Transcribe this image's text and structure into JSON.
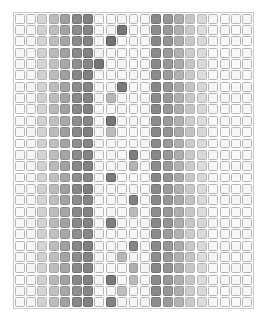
{
  "figure": {
    "title": "",
    "background_color": "#ffffff",
    "frame_color": "#c9c9c9",
    "cell_border_color": "#b5b5b5"
  },
  "chart_data": {
    "type": "heatmap",
    "title": "",
    "subtitle": "",
    "xlabel": "",
    "ylabel": "",
    "grid": true,
    "legend": "none",
    "n_columns": 21,
    "n_rows": 26,
    "xlim": [
      0,
      21
    ],
    "ylim": [
      0,
      26
    ],
    "x_tick_labels": [],
    "y_tick_labels": [],
    "value_range": [
      0,
      1
    ],
    "colormap": "grayscale-inverted",
    "bands": [
      {
        "name": "left-band",
        "start_column": 2,
        "end_column": 6,
        "intensities": [
          0.22,
          0.34,
          0.47,
          0.6,
          0.66
        ]
      },
      {
        "name": "right-band",
        "start_column": 12,
        "end_column": 16,
        "intensities": [
          0.64,
          0.56,
          0.44,
          0.3,
          0.2
        ]
      }
    ],
    "values": [
      [
        0.03,
        0.05,
        0.22,
        0.36,
        0.5,
        0.62,
        0.66,
        0.05,
        0.04,
        0.06,
        0.05,
        0.04,
        0.62,
        0.55,
        0.44,
        0.3,
        0.2,
        0.05,
        0.03,
        0.04,
        0.05
      ],
      [
        0.04,
        0.05,
        0.24,
        0.34,
        0.48,
        0.6,
        0.64,
        0.04,
        0.06,
        0.72,
        0.05,
        0.04,
        0.6,
        0.54,
        0.42,
        0.28,
        0.18,
        0.04,
        0.05,
        0.03,
        0.04
      ],
      [
        0.03,
        0.06,
        0.23,
        0.35,
        0.47,
        0.61,
        0.65,
        0.05,
        0.74,
        0.05,
        0.06,
        0.05,
        0.63,
        0.56,
        0.43,
        0.29,
        0.2,
        0.05,
        0.04,
        0.05,
        0.03
      ],
      [
        0.05,
        0.04,
        0.25,
        0.37,
        0.49,
        0.62,
        0.66,
        0.06,
        0.05,
        0.04,
        0.05,
        0.03,
        0.61,
        0.53,
        0.41,
        0.27,
        0.19,
        0.04,
        0.03,
        0.04,
        0.05
      ],
      [
        0.04,
        0.05,
        0.22,
        0.33,
        0.46,
        0.59,
        0.63,
        0.72,
        0.05,
        0.06,
        0.04,
        0.05,
        0.62,
        0.55,
        0.44,
        0.3,
        0.2,
        0.05,
        0.05,
        0.03,
        0.04
      ],
      [
        0.03,
        0.05,
        0.24,
        0.36,
        0.5,
        0.63,
        0.67,
        0.05,
        0.04,
        0.05,
        0.06,
        0.04,
        0.6,
        0.52,
        0.4,
        0.28,
        0.18,
        0.04,
        0.04,
        0.05,
        0.03
      ],
      [
        0.05,
        0.06,
        0.23,
        0.34,
        0.48,
        0.6,
        0.64,
        0.05,
        0.06,
        0.7,
        0.04,
        0.05,
        0.63,
        0.56,
        0.45,
        0.31,
        0.21,
        0.05,
        0.03,
        0.04,
        0.05
      ],
      [
        0.04,
        0.05,
        0.25,
        0.35,
        0.47,
        0.61,
        0.65,
        0.06,
        0.38,
        0.05,
        0.05,
        0.04,
        0.61,
        0.54,
        0.42,
        0.29,
        0.19,
        0.04,
        0.05,
        0.05,
        0.04
      ],
      [
        0.03,
        0.04,
        0.22,
        0.37,
        0.49,
        0.62,
        0.66,
        0.05,
        0.04,
        0.06,
        0.04,
        0.05,
        0.62,
        0.55,
        0.43,
        0.3,
        0.2,
        0.05,
        0.04,
        0.03,
        0.05
      ],
      [
        0.05,
        0.05,
        0.24,
        0.33,
        0.46,
        0.59,
        0.63,
        0.04,
        0.72,
        0.05,
        0.06,
        0.04,
        0.6,
        0.53,
        0.41,
        0.27,
        0.18,
        0.03,
        0.05,
        0.04,
        0.04
      ],
      [
        0.04,
        0.06,
        0.23,
        0.36,
        0.5,
        0.63,
        0.67,
        0.05,
        0.35,
        0.05,
        0.04,
        0.05,
        0.63,
        0.56,
        0.44,
        0.31,
        0.21,
        0.05,
        0.03,
        0.05,
        0.03
      ],
      [
        0.03,
        0.05,
        0.25,
        0.34,
        0.48,
        0.6,
        0.64,
        0.06,
        0.05,
        0.04,
        0.05,
        0.06,
        0.61,
        0.54,
        0.42,
        0.28,
        0.19,
        0.04,
        0.04,
        0.04,
        0.05
      ],
      [
        0.05,
        0.04,
        0.22,
        0.35,
        0.47,
        0.61,
        0.65,
        0.05,
        0.06,
        0.05,
        0.68,
        0.05,
        0.62,
        0.55,
        0.43,
        0.29,
        0.2,
        0.05,
        0.05,
        0.03,
        0.04
      ],
      [
        0.04,
        0.05,
        0.24,
        0.37,
        0.49,
        0.62,
        0.66,
        0.04,
        0.05,
        0.06,
        0.4,
        0.04,
        0.6,
        0.52,
        0.4,
        0.27,
        0.18,
        0.04,
        0.03,
        0.05,
        0.05
      ],
      [
        0.03,
        0.06,
        0.23,
        0.33,
        0.46,
        0.59,
        0.63,
        0.05,
        0.7,
        0.05,
        0.04,
        0.05,
        0.63,
        0.56,
        0.45,
        0.3,
        0.21,
        0.05,
        0.04,
        0.04,
        0.03
      ],
      [
        0.05,
        0.05,
        0.25,
        0.36,
        0.5,
        0.63,
        0.67,
        0.06,
        0.04,
        0.05,
        0.06,
        0.04,
        0.61,
        0.53,
        0.41,
        0.28,
        0.19,
        0.03,
        0.05,
        0.03,
        0.04
      ],
      [
        0.04,
        0.04,
        0.22,
        0.34,
        0.48,
        0.6,
        0.64,
        0.05,
        0.05,
        0.06,
        0.66,
        0.05,
        0.62,
        0.55,
        0.44,
        0.31,
        0.2,
        0.05,
        0.04,
        0.05,
        0.05
      ],
      [
        0.03,
        0.05,
        0.24,
        0.35,
        0.47,
        0.61,
        0.65,
        0.04,
        0.06,
        0.04,
        0.36,
        0.04,
        0.6,
        0.54,
        0.42,
        0.29,
        0.18,
        0.04,
        0.03,
        0.04,
        0.03
      ],
      [
        0.05,
        0.06,
        0.23,
        0.37,
        0.49,
        0.62,
        0.66,
        0.05,
        0.68,
        0.05,
        0.05,
        0.06,
        0.63,
        0.56,
        0.43,
        0.3,
        0.21,
        0.05,
        0.05,
        0.03,
        0.04
      ],
      [
        0.04,
        0.05,
        0.25,
        0.33,
        0.46,
        0.59,
        0.63,
        0.06,
        0.04,
        0.05,
        0.04,
        0.05,
        0.61,
        0.52,
        0.4,
        0.27,
        0.19,
        0.03,
        0.04,
        0.05,
        0.05
      ],
      [
        0.03,
        0.04,
        0.22,
        0.36,
        0.5,
        0.63,
        0.67,
        0.05,
        0.05,
        0.06,
        0.64,
        0.04,
        0.62,
        0.55,
        0.45,
        0.28,
        0.2,
        0.04,
        0.05,
        0.04,
        0.03
      ],
      [
        0.05,
        0.05,
        0.24,
        0.34,
        0.48,
        0.6,
        0.64,
        0.04,
        0.06,
        0.38,
        0.05,
        0.05,
        0.6,
        0.53,
        0.41,
        0.31,
        0.18,
        0.05,
        0.03,
        0.03,
        0.04
      ],
      [
        0.04,
        0.06,
        0.23,
        0.35,
        0.47,
        0.61,
        0.65,
        0.05,
        0.04,
        0.05,
        0.42,
        0.06,
        0.63,
        0.56,
        0.44,
        0.29,
        0.21,
        0.04,
        0.04,
        0.05,
        0.05
      ],
      [
        0.03,
        0.05,
        0.25,
        0.37,
        0.49,
        0.62,
        0.66,
        0.06,
        0.7,
        0.05,
        0.36,
        0.04,
        0.61,
        0.54,
        0.42,
        0.3,
        0.19,
        0.05,
        0.05,
        0.04,
        0.03
      ],
      [
        0.05,
        0.04,
        0.22,
        0.33,
        0.46,
        0.59,
        0.63,
        0.05,
        0.05,
        0.35,
        0.05,
        0.05,
        0.62,
        0.55,
        0.43,
        0.27,
        0.2,
        0.03,
        0.03,
        0.05,
        0.04
      ],
      [
        0.04,
        0.05,
        0.24,
        0.36,
        0.5,
        0.63,
        0.67,
        0.04,
        0.66,
        0.06,
        0.04,
        0.06,
        0.6,
        0.52,
        0.4,
        0.28,
        0.18,
        0.04,
        0.04,
        0.03,
        0.05
      ]
    ]
  }
}
